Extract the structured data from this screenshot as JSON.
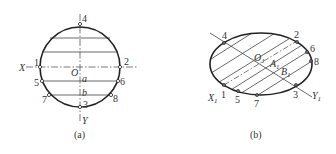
{
  "figure_a": {
    "caption": "(a)",
    "axis_x_label": "X",
    "axis_y_label": "Y",
    "center_label": "O",
    "chord_labels": [
      "a",
      "b"
    ],
    "points": [
      "1",
      "2",
      "3",
      "4",
      "5",
      "6",
      "7",
      "8"
    ]
  },
  "figure_b": {
    "caption": "(b)",
    "axis_x_label": "X",
    "axis_x_sub": "1",
    "axis_y_label": "Y",
    "axis_y_sub": "1",
    "center_label": "O",
    "center_sub": "1",
    "a_label": "A",
    "a_sub": "1",
    "b_label": "B",
    "b_sub": "1",
    "points": [
      "1",
      "2",
      "3",
      "4",
      "5",
      "6",
      "7",
      "8"
    ]
  },
  "colors": {
    "stroke": "#222222",
    "thin": "#444444",
    "text": "#333333"
  }
}
